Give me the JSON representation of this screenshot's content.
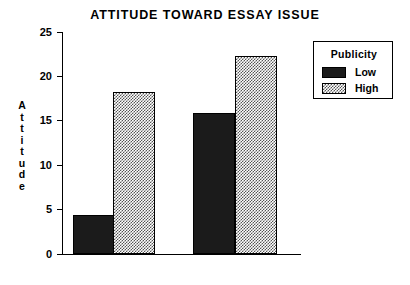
{
  "chart_data": {
    "type": "bar",
    "title": "ATTITUDE TOWARD ESSAY ISSUE",
    "xlabel": "",
    "ylabel": "Attitude",
    "ylim": [
      0,
      25
    ],
    "yticks": [
      0,
      5,
      10,
      15,
      20,
      25
    ],
    "ytick_labels": [
      "0",
      "5",
      "10",
      "15",
      "20",
      "25"
    ],
    "grid": false,
    "categories": [
      "Group 1",
      "Group 2"
    ],
    "legend": {
      "title": "Publicity",
      "position": "right",
      "entries": [
        {
          "label": "Low",
          "swatch": "solid-black",
          "color": "#1b1b1b"
        },
        {
          "label": "High",
          "swatch": "checker-hatch",
          "color": "#8a8a8a"
        }
      ]
    },
    "series": [
      {
        "name": "Low",
        "values": [
          4.4,
          15.9
        ]
      },
      {
        "name": "High",
        "values": [
          18.3,
          22.3
        ]
      }
    ],
    "bars": [
      {
        "group": "Group 1",
        "series": "Low",
        "value": 4.4,
        "style": "low"
      },
      {
        "group": "Group 1",
        "series": "High",
        "value": 18.3,
        "style": "high"
      },
      {
        "group": "Group 2",
        "series": "Low",
        "value": 15.9,
        "style": "low"
      },
      {
        "group": "Group 2",
        "series": "High",
        "value": 22.3,
        "style": "high"
      }
    ]
  },
  "axis": {
    "y_title_letters": [
      "A",
      "t",
      "t",
      "i",
      "t",
      "u",
      "d",
      "e"
    ]
  }
}
